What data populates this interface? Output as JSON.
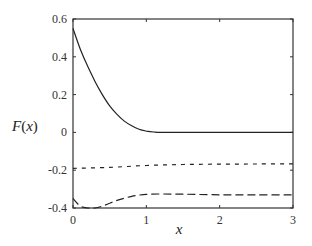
{
  "chart_data": {
    "type": "line",
    "title": "",
    "xlabel": "x",
    "ylabel": "F(x)",
    "xlim": [
      0,
      3
    ],
    "ylim": [
      -0.4,
      0.6
    ],
    "xticks": [
      "0",
      "1",
      "2",
      "3"
    ],
    "yticks": [
      "0.6",
      "0.4",
      "0.2",
      "0",
      "-0.2",
      "-0.4"
    ],
    "grid": false,
    "legend": null,
    "series": [
      {
        "name": "solid",
        "style": "solid",
        "x": [
          0,
          0.1,
          0.2,
          0.3,
          0.4,
          0.5,
          0.6,
          0.7,
          0.8,
          0.9,
          1.0,
          1.1,
          1.2,
          1.5,
          2.0,
          2.5,
          3.0
        ],
        "y": [
          0.55,
          0.44,
          0.35,
          0.27,
          0.2,
          0.14,
          0.095,
          0.06,
          0.035,
          0.017,
          0.007,
          0.002,
          0.0,
          0.0,
          0.0,
          0.0,
          0.0
        ]
      },
      {
        "name": "dotted",
        "style": "dotted",
        "x": [
          0,
          0.5,
          1.0,
          1.5,
          2.0,
          2.5,
          3.0
        ],
        "y": [
          -0.19,
          -0.185,
          -0.175,
          -0.17,
          -0.168,
          -0.167,
          -0.166
        ]
      },
      {
        "name": "dashed",
        "style": "dashed",
        "x": [
          0,
          0.1,
          0.2,
          0.3,
          0.4,
          0.5,
          0.6,
          0.7,
          0.8,
          0.9,
          1.0,
          1.2,
          1.5,
          2.0,
          2.5,
          3.0
        ],
        "y": [
          -0.35,
          -0.39,
          -0.4,
          -0.4,
          -0.39,
          -0.375,
          -0.36,
          -0.348,
          -0.338,
          -0.332,
          -0.328,
          -0.326,
          -0.327,
          -0.33,
          -0.33,
          -0.33
        ]
      }
    ]
  }
}
